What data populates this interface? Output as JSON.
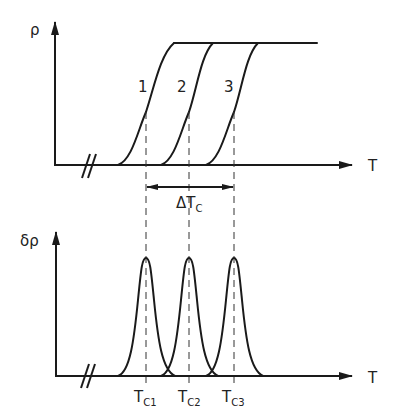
{
  "top_plot": {
    "y_axis_label": "ρ",
    "x_axis_label": "T",
    "curve_labels": [
      "1",
      "2",
      "3"
    ],
    "delta_label_main": "ΔT",
    "delta_label_sub": "C"
  },
  "bottom_plot": {
    "y_axis_label": "δρ",
    "x_axis_label": "T",
    "tick_labels": [
      {
        "main": "T",
        "sub": "C1"
      },
      {
        "main": "T",
        "sub": "C2"
      },
      {
        "main": "T",
        "sub": "C3"
      }
    ]
  },
  "colors": {
    "ink": "#1a1a1a",
    "background": "#ffffff"
  }
}
